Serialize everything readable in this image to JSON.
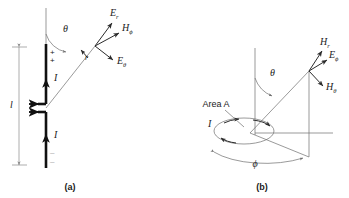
{
  "figure": {
    "panels": [
      {
        "id": "a",
        "caption": "(a)",
        "title": "short dipole antenna",
        "labels": {
          "field_radial": "E",
          "field_radial_sub": "r",
          "field_h": "H",
          "field_h_sub": "ϕ",
          "field_theta": "E",
          "field_theta_sub": "θ",
          "angle_theta": "θ",
          "radius": "r",
          "current_upper": "I",
          "current_lower": "I",
          "length": "l",
          "charge_positive": "+",
          "charge_negative": "–"
        }
      },
      {
        "id": "b",
        "caption": "(b)",
        "title": "small loop antenna",
        "labels": {
          "field_radial": "H",
          "field_radial_sub": "r",
          "field_e": "E",
          "field_e_sub": "ϕ",
          "field_theta": "H",
          "field_theta_sub": "θ",
          "angle_theta": "θ",
          "angle_phi": "ϕ",
          "area": "Area A",
          "current": "I"
        }
      }
    ]
  },
  "colors": {
    "conductor": "#111111",
    "vector": "#2b2b2b",
    "construction": "#6e6e6e",
    "dimension": "#8a8a8a",
    "background": "#ffffff"
  }
}
